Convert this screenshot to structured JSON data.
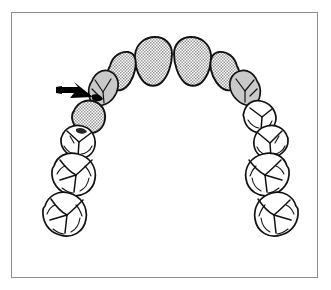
{
  "figure": {
    "title": "Maxillary dental arch, occlusal view",
    "frame": {
      "border_color": "#8d8d8d",
      "background_color": "#ffffff"
    },
    "colors": {
      "outline": "#111111",
      "stipple_fill": "#cfcfcf",
      "gray_fill": "#c9c9c9",
      "white_fill": "#ffffff",
      "arrow": "#000000"
    },
    "annotation": {
      "arrow_name": "contact-point-arrow",
      "arrow_direction": "points down-right",
      "target": "contact between left canine and left first premolar"
    },
    "teeth": [
      {
        "id": "ur-central-incisor",
        "label": "Right central incisor",
        "fill": "stippled"
      },
      {
        "id": "ul-central-incisor",
        "label": "Left central incisor",
        "fill": "stippled"
      },
      {
        "id": "ur-lateral-incisor",
        "label": "Right lateral incisor",
        "fill": "stippled"
      },
      {
        "id": "ul-lateral-incisor",
        "label": "Left lateral incisor",
        "fill": "stippled"
      },
      {
        "id": "ur-canine",
        "label": "Right canine",
        "fill": "gray"
      },
      {
        "id": "ul-canine",
        "label": "Left canine",
        "fill": "gray"
      },
      {
        "id": "ur-first-premolar",
        "label": "Right first premolar",
        "fill": "white"
      },
      {
        "id": "ul-first-premolar",
        "label": "Left first premolar",
        "fill": "stippled"
      },
      {
        "id": "ur-second-premolar",
        "label": "Right second premolar",
        "fill": "white"
      },
      {
        "id": "ul-second-premolar",
        "label": "Left second premolar",
        "fill": "white"
      },
      {
        "id": "ur-first-molar",
        "label": "Right first molar",
        "fill": "white"
      },
      {
        "id": "ul-first-molar",
        "label": "Left first molar",
        "fill": "white"
      },
      {
        "id": "ur-second-molar",
        "label": "Right second molar",
        "fill": "white"
      },
      {
        "id": "ul-second-molar",
        "label": "Left second molar",
        "fill": "white"
      }
    ]
  }
}
